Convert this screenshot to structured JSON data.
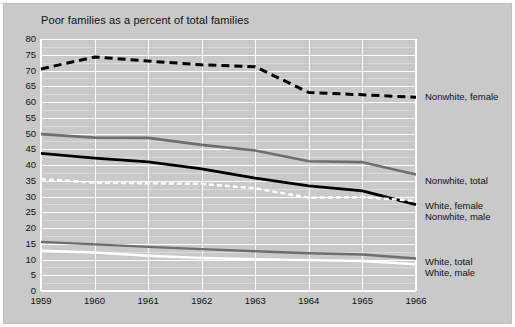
{
  "chart_data": {
    "type": "line",
    "title": "Poor families as a percent of total families",
    "xlabel": "",
    "ylabel": "",
    "xlim": [
      1959,
      1966
    ],
    "ylim": [
      0,
      80
    ],
    "ytick_step": 5,
    "grid": true,
    "legend_position": "right-inline",
    "x": [
      1959,
      1960,
      1961,
      1962,
      1963,
      1964,
      1965,
      1966
    ],
    "ytick_labels": [
      "80",
      "75",
      "70",
      "65",
      "60",
      "55",
      "50",
      "45",
      "40",
      "35",
      "30",
      "25",
      "20",
      "15",
      "10",
      "5",
      "0"
    ],
    "xtick_labels": [
      "1959",
      "1960",
      "1961",
      "1962",
      "1963",
      "1964",
      "1965",
      "1966"
    ],
    "series": [
      {
        "name": "Nonwhite, female",
        "style": "dashed",
        "color": "#000000",
        "width": 3,
        "values": [
          70.5,
          74.3,
          73.0,
          71.8,
          71.2,
          63.0,
          62.3,
          61.5
        ]
      },
      {
        "name": "Nonwhite, total",
        "style": "solid",
        "color": "#6e6e6e",
        "width": 2.6,
        "values": [
          49.8,
          48.7,
          48.6,
          46.4,
          44.6,
          41.2,
          40.9,
          37.0
        ]
      },
      {
        "name": "Nonwhite, male",
        "style": "solid",
        "color": "#000000",
        "width": 2.8,
        "values": [
          43.7,
          42.2,
          41.0,
          38.8,
          35.8,
          33.4,
          31.8,
          27.4
        ]
      },
      {
        "name": "White, female",
        "style": "dashed",
        "color": "#ffffff",
        "width": 2.4,
        "values": [
          35.5,
          34.4,
          34.2,
          34.0,
          32.6,
          29.6,
          29.8,
          28.6
        ]
      },
      {
        "name": "White, total",
        "style": "solid",
        "color": "#6e6e6e",
        "width": 2.4,
        "values": [
          15.6,
          14.8,
          14.0,
          13.3,
          12.6,
          12.0,
          11.6,
          10.3
        ]
      },
      {
        "name": "White, male",
        "style": "solid",
        "color": "#ffffff",
        "width": 2.4,
        "values": [
          12.8,
          12.2,
          11.2,
          10.5,
          10.1,
          9.8,
          9.5,
          8.5
        ]
      }
    ],
    "annotations": [
      {
        "text": "Nonwhite, female",
        "for": "Nonwhite, female",
        "y_value": 61.5
      },
      {
        "text": "Nonwhite, total",
        "for": "Nonwhite, total",
        "y_value": 37.0
      },
      {
        "text": "White, female",
        "for": "White, female",
        "y_value": 28.6
      },
      {
        "text": "Nonwhite, male",
        "for": "Nonwhite, male",
        "y_value": 27.4
      },
      {
        "text": "White, total",
        "for": "White, total",
        "y_value": 10.3
      },
      {
        "text": "White, male",
        "for": "White, male",
        "y_value": 8.5
      }
    ]
  },
  "legend": {
    "nonwhite_female": "Nonwhite, female",
    "nonwhite_total": "Nonwhite, total",
    "white_female": "White, female",
    "nonwhite_male": "Nonwhite, male",
    "white_total": "White, total",
    "white_male": "White, male"
  },
  "colors": {
    "figure_background": "#c9c9c9",
    "page_background": "#ffffff",
    "grid_major": "#ffffff",
    "grid_minor": "#f2f2f2",
    "text": "#111111",
    "series_black": "#000000",
    "series_gray": "#6e6e6e",
    "series_white": "#ffffff"
  }
}
